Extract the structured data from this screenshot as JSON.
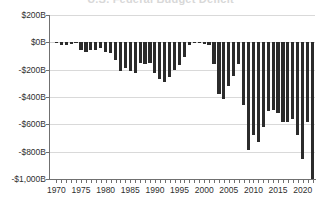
{
  "chart_data": {
    "type": "bar",
    "title": "U.S. Federal Budget Deficit",
    "xlabel": "",
    "ylabel": "",
    "ylim": [
      -1000,
      200
    ],
    "xlim": [
      1969,
      2023
    ],
    "grid": true,
    "legend": "none",
    "bar_color": "#2b2b2b",
    "y_ticks": [
      200,
      0,
      -200,
      -400,
      -600,
      -800,
      -1000
    ],
    "y_tick_labels": [
      "$200B",
      "$0B",
      "-$200B",
      "-$400B",
      "-$600B",
      "-$800B",
      "-$1,000B"
    ],
    "x_ticks": [
      1970,
      1975,
      1980,
      1985,
      1990,
      1995,
      2000,
      2005,
      2010,
      2015,
      2020
    ],
    "x_tick_labels": [
      "1970",
      "1975",
      "1980",
      "1985",
      "1990",
      "1995",
      "2000",
      "2005",
      "2010",
      "2015",
      "2020"
    ],
    "categories": [
      1970,
      1971,
      1972,
      1973,
      1974,
      1975,
      1976,
      1977,
      1978,
      1979,
      1980,
      1981,
      1982,
      1983,
      1984,
      1985,
      1986,
      1987,
      1988,
      1989,
      1990,
      1991,
      1992,
      1993,
      1994,
      1995,
      1996,
      1997,
      1998,
      1999,
      2000,
      2001,
      2002,
      2003,
      2004,
      2005,
      2006,
      2007,
      2008,
      2009,
      2010,
      2011,
      2012,
      2013,
      2014,
      2015,
      2016,
      2017,
      2018,
      2019,
      2020,
      2021,
      2022
    ],
    "values": [
      -3,
      -23,
      -23,
      -15,
      -6,
      -53,
      -74,
      -54,
      -59,
      -41,
      -74,
      -79,
      -128,
      -208,
      -185,
      -212,
      -221,
      -150,
      -155,
      -153,
      -221,
      -269,
      -290,
      -255,
      -203,
      -164,
      -107,
      -22,
      69,
      126,
      236,
      128,
      -158,
      -378,
      -413,
      -318,
      -248,
      -161,
      -459,
      -1413,
      -1294,
      -1300,
      -1087,
      -680,
      -485,
      -438,
      -585,
      -665,
      -779,
      -984,
      -3132,
      -2772,
      -1375
    ],
    "plot_values": [
      -3,
      -23,
      -23,
      -15,
      -6,
      -53,
      -74,
      -54,
      -59,
      -41,
      -74,
      -79,
      -128,
      -208,
      -185,
      -212,
      -221,
      -150,
      -155,
      -153,
      -221,
      -269,
      -290,
      -255,
      -203,
      -164,
      -107,
      -22,
      -5,
      -8,
      -12,
      -18,
      -158,
      -378,
      -413,
      -318,
      -248,
      -161,
      -459,
      -790,
      -680,
      -730,
      -620,
      -505,
      -495,
      -520,
      -585,
      -585,
      -560,
      -680,
      -855,
      -580,
      -1030
    ]
  }
}
